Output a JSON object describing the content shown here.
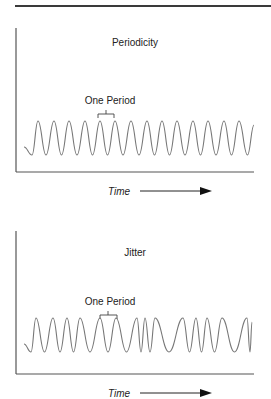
{
  "panels": [
    {
      "title": "Periodicity",
      "period_label": "One Period",
      "axis_label": "Time",
      "wave_type": "periodic",
      "peaks_x": [
        38,
        54,
        69,
        85,
        100,
        115,
        131,
        147,
        162,
        177,
        193,
        208,
        224,
        239
      ],
      "bracket": {
        "x1": 98,
        "x2": 114
      }
    },
    {
      "title": "Jitter",
      "period_label": "One Period",
      "axis_label": "Time",
      "wave_type": "jittered",
      "peaks_x": [
        36,
        53,
        67,
        80,
        100,
        116,
        137,
        145,
        155,
        183,
        196,
        207,
        222,
        247
      ],
      "bracket": {
        "x1": 100,
        "x2": 117
      }
    }
  ],
  "colors": {
    "axis": "#555555",
    "wave": "#777777",
    "text": "#222222",
    "rule": "#3a3a3a"
  }
}
